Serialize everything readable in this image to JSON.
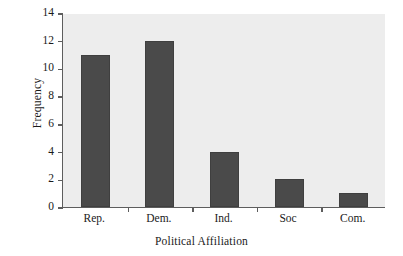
{
  "chart_data": {
    "type": "bar",
    "title": "",
    "xlabel": "Political Affiliation",
    "ylabel": "Frequency",
    "categories": [
      "Rep.",
      "Dem.",
      "Ind.",
      "Soc",
      "Com."
    ],
    "values": [
      11,
      12,
      4,
      2,
      1
    ],
    "ylim": [
      0,
      14
    ],
    "yticks": [
      0,
      2,
      4,
      6,
      8,
      10,
      12,
      14
    ],
    "ytick_labels": [
      "0",
      "2",
      "4",
      "6",
      "8",
      "10",
      "12",
      "14"
    ],
    "grid": false,
    "legend": null,
    "bar_color": "#4a4a4a",
    "plot_background": "#ededed",
    "axis_color": "#5d5d5d",
    "text_color": "#1a1a1a"
  }
}
